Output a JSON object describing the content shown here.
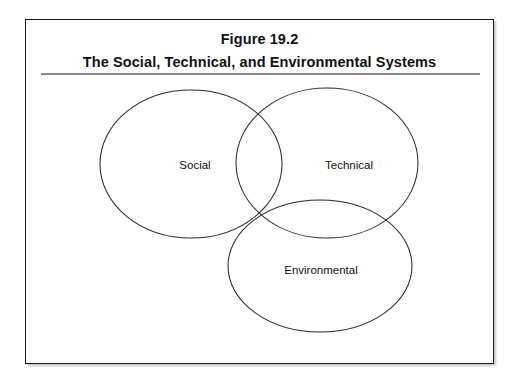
{
  "figure": {
    "number": "Figure 19.2",
    "caption": "The Social, Technical, and Environmental Systems"
  },
  "diagram": {
    "type": "venn",
    "sets": [
      {
        "id": "social",
        "label": "Social"
      },
      {
        "id": "technical",
        "label": "Technical"
      },
      {
        "id": "environmental",
        "label": "Environmental"
      }
    ]
  },
  "colors": {
    "frame_border": "#1c1c1c",
    "rule": "#8b8b8b",
    "circle_stroke": "#2b2b2b",
    "text": "#111111",
    "background": "#ffffff"
  }
}
